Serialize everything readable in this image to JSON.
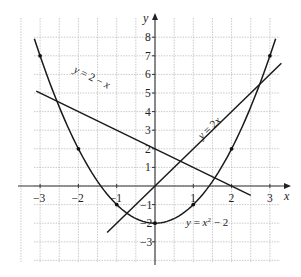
{
  "chart_data": {
    "type": "line",
    "title": "",
    "xlabel": "x",
    "ylabel": "y",
    "xlim": [
      -3.4,
      3.4
    ],
    "ylim": [
      -3.8,
      8.5
    ],
    "grid": true,
    "grid_spacing": {
      "x": 0.5,
      "y": 1
    },
    "x_ticks": [
      -3,
      -2,
      -1,
      1,
      2,
      3
    ],
    "x_tick_labels": [
      "−3",
      "−2",
      "−1",
      "1",
      "2",
      "3"
    ],
    "y_ticks": [
      -3,
      -2,
      -1,
      1,
      2,
      3,
      4,
      5,
      6,
      7,
      8
    ],
    "y_tick_labels": [
      "−3",
      "−2",
      "−1",
      "1",
      "2",
      "3",
      "4",
      "5",
      "6",
      "7",
      "8"
    ],
    "series": [
      {
        "name": "y = x² − 2",
        "kind": "curve",
        "x_range": [
          -3.15,
          3.15
        ],
        "marked_points": [
          [
            -3,
            7
          ],
          [
            -2,
            2
          ],
          [
            -1,
            -1
          ],
          [
            0,
            -2
          ],
          [
            1,
            -1
          ],
          [
            2,
            2
          ],
          [
            3,
            7
          ]
        ]
      },
      {
        "name": "y = 2 − x",
        "kind": "line",
        "x_range": [
          -3.1,
          2.5
        ],
        "points": [
          [
            -3.1,
            5.1
          ],
          [
            2.5,
            -0.5
          ]
        ]
      },
      {
        "name": "y = 2x",
        "kind": "line",
        "x_range": [
          -1.25,
          3.3
        ],
        "points": [
          [
            -1.25,
            -2.5
          ],
          [
            3.3,
            6.6
          ]
        ]
      }
    ],
    "annotations": [
      {
        "text": "y = 2 − x",
        "near": [
          -1.7,
          4.1
        ]
      },
      {
        "text": "y = 2x",
        "near": [
          1.15,
          3.2
        ]
      },
      {
        "text": "y = x² − 2",
        "near": [
          1.3,
          -2
        ]
      }
    ]
  },
  "labels": {
    "x_axis": "x",
    "y_axis": "y",
    "eq_line1_a": "y",
    "eq_line1_b": " = 2 − ",
    "eq_line1_c": "x",
    "eq_line2_a": "y",
    "eq_line2_b": " = 2",
    "eq_line2_c": "x",
    "eq_parab_a": "y",
    "eq_parab_b": " = ",
    "eq_parab_c": "x",
    "eq_parab_sup": "2",
    "eq_parab_d": " − 2"
  }
}
